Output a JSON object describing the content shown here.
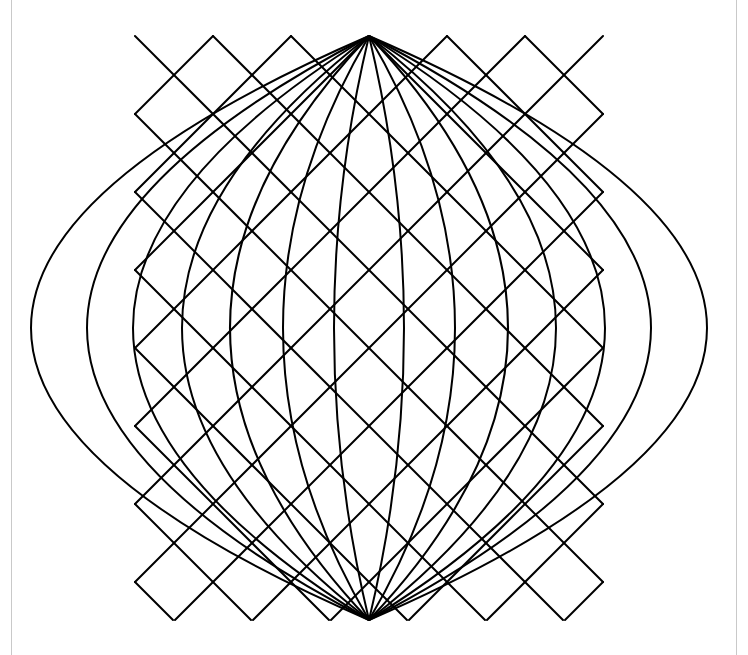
{
  "page": {
    "width": 748,
    "height": 655,
    "background_color": "#ffffff",
    "border_color": "#c9c9c9",
    "border_left_x": 11,
    "border_right_x": 736
  },
  "figure": {
    "name": "concentric-lens-diamond-lattice",
    "stroke_color": "#000000",
    "stroke_width": 2,
    "fill": "none",
    "center_x": 369,
    "center_y": 328,
    "apex_top_y": 36,
    "apex_bottom_y": 620,
    "apex_spacing": 78,
    "apex_count": 7,
    "apex_x_positions": [
      135,
      213,
      291,
      369,
      447,
      525,
      603
    ],
    "lens_half_widths": [
      338,
      282,
      236,
      187,
      139,
      86,
      35
    ],
    "diagonal_slope_degrees": 45,
    "inner_diamond": {
      "center_x": 369,
      "center_y": 327,
      "half_width": 35,
      "half_height": 35,
      "left_x": 334,
      "right_x": 404,
      "top_y": 292,
      "bottom_y": 362
    }
  },
  "chart_data": {
    "type": "line",
    "xlabel": "",
    "ylabel": "",
    "xlim": [
      0,
      748
    ],
    "ylim": [
      0,
      655
    ],
    "grid": false,
    "legend": "none",
    "series": [
      {
        "name": "lens-1",
        "half_width": 338,
        "apex_x": 369,
        "top_y": 36,
        "bottom_y": 620
      },
      {
        "name": "lens-2",
        "half_width": 282,
        "apex_x": 369,
        "top_y": 36,
        "bottom_y": 620
      },
      {
        "name": "lens-3",
        "half_width": 236,
        "apex_x": 369,
        "top_y": 36,
        "bottom_y": 620
      },
      {
        "name": "lens-4",
        "half_width": 187,
        "apex_x": 369,
        "top_y": 36,
        "bottom_y": 620
      },
      {
        "name": "lens-5",
        "half_width": 139,
        "apex_x": 369,
        "top_y": 36,
        "bottom_y": 620
      },
      {
        "name": "lens-6",
        "half_width": 86,
        "apex_x": 369,
        "top_y": 36,
        "bottom_y": 620
      },
      {
        "name": "lens-7",
        "half_width": 35,
        "apex_x": 369,
        "top_y": 36,
        "bottom_y": 620
      },
      {
        "name": "diagonals-down-right",
        "count": 7,
        "angle_degrees": -45
      },
      {
        "name": "diagonals-down-left",
        "count": 7,
        "angle_degrees": 45
      }
    ]
  }
}
